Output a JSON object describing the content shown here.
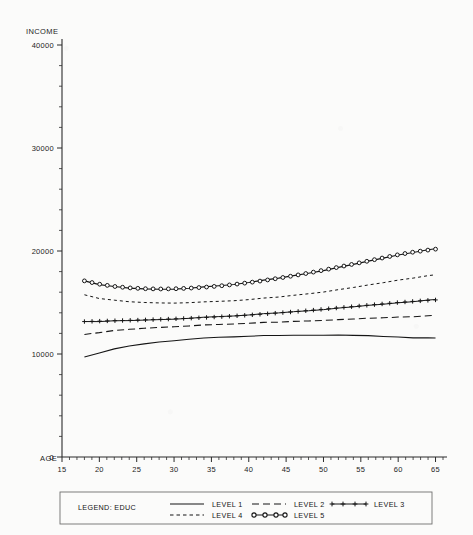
{
  "chart_data": {
    "type": "line",
    "title": "",
    "xlabel": "AGE",
    "ylabel": "INCOME",
    "xlim": [
      15,
      66
    ],
    "ylim": [
      0,
      40000
    ],
    "grid": false,
    "x_ticks": [
      15,
      20,
      25,
      30,
      35,
      40,
      45,
      50,
      55,
      60,
      65
    ],
    "x_tick_labels": [
      "15",
      "20",
      "25",
      "30",
      "35",
      "40",
      "45",
      "50",
      "55",
      "60",
      "65"
    ],
    "y_ticks": [
      0,
      10000,
      20000,
      30000,
      40000
    ],
    "y_tick_labels": [
      "0",
      "10000",
      "20000",
      "30000",
      "40000"
    ],
    "x": [
      18,
      20,
      22,
      24,
      26,
      28,
      30,
      32,
      34,
      36,
      38,
      40,
      42,
      44,
      46,
      48,
      50,
      52,
      54,
      56,
      58,
      60,
      62,
      64,
      65
    ],
    "series": [
      {
        "name": "LEVEL 1",
        "style": "solid",
        "marker": "none",
        "values": [
          9700,
          10150,
          10500,
          10800,
          11000,
          11180,
          11320,
          11430,
          11520,
          11600,
          11660,
          11710,
          11750,
          11790,
          11820,
          11840,
          11860,
          11860,
          11840,
          11800,
          11740,
          11670,
          11600,
          11540,
          11510
        ]
      },
      {
        "name": "LEVEL 2",
        "style": "long-dash",
        "marker": "none",
        "values": [
          11900,
          12120,
          12290,
          12420,
          12520,
          12600,
          12670,
          12730,
          12790,
          12850,
          12910,
          12970,
          13030,
          13090,
          13160,
          13230,
          13300,
          13360,
          13430,
          13490,
          13550,
          13610,
          13650,
          13690,
          13700
        ]
      },
      {
        "name": "LEVEL 3",
        "style": "solid",
        "marker": "plus",
        "values": [
          13150,
          13190,
          13230,
          13270,
          13310,
          13360,
          13410,
          13470,
          13540,
          13610,
          13690,
          13780,
          13880,
          13990,
          14100,
          14220,
          14350,
          14480,
          14610,
          14740,
          14870,
          15000,
          15110,
          15210,
          15250
        ]
      },
      {
        "name": "LEVEL 4",
        "style": "short-dash",
        "marker": "none",
        "values": [
          15750,
          15430,
          15230,
          15100,
          15020,
          14980,
          14970,
          14990,
          15030,
          15090,
          15170,
          15270,
          15390,
          15530,
          15690,
          15870,
          16060,
          16270,
          16490,
          16720,
          16960,
          17200,
          17400,
          17580,
          17650
        ]
      },
      {
        "name": "LEVEL 5",
        "style": "solid",
        "marker": "circle",
        "values": [
          17100,
          16780,
          16560,
          16420,
          16340,
          16310,
          16330,
          16390,
          16480,
          16600,
          16750,
          16930,
          17130,
          17360,
          17600,
          17860,
          18140,
          18430,
          18730,
          19030,
          19340,
          19640,
          19890,
          20090,
          20180
        ]
      }
    ]
  },
  "legend": {
    "title": "LEGEND: EDUC",
    "entries": [
      {
        "label": "LEVEL 1",
        "style": "solid",
        "marker": "none"
      },
      {
        "label": "LEVEL 2",
        "style": "long-dash",
        "marker": "none"
      },
      {
        "label": "LEVEL 3",
        "style": "solid",
        "marker": "plus"
      },
      {
        "label": "LEVEL 4",
        "style": "short-dash",
        "marker": "none"
      },
      {
        "label": "LEVEL 5",
        "style": "solid",
        "marker": "circle"
      }
    ]
  },
  "axis": {
    "y_title": "INCOME",
    "x_title": "AGE"
  }
}
